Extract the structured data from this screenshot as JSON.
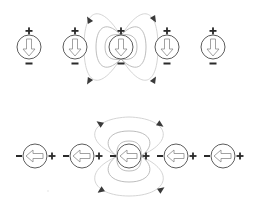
{
  "diagram": {
    "colors": {
      "background": "#ffffff",
      "magnet_outline": "#4a4a4a",
      "arrow_outline": "#8a8a8a",
      "field_line": "#cfcfcf",
      "sign": "#2a2a2a"
    },
    "top_row": {
      "orientation": "vertical-down",
      "arrow_direction": "down",
      "positive_label": "+",
      "negative_label": "−",
      "positive_position": "top",
      "negative_position": "bottom",
      "dipoles": [
        {
          "cx": 29,
          "cy": 47
        },
        {
          "cx": 75,
          "cy": 47
        },
        {
          "cx": 121,
          "cy": 47,
          "highlighted": true
        },
        {
          "cx": 167,
          "cy": 47
        },
        {
          "cx": 213,
          "cy": 47
        }
      ],
      "field_arrowheads": [
        {
          "x": 89,
          "y": 20,
          "direction": "up"
        },
        {
          "x": 154,
          "y": 19,
          "direction": "down"
        },
        {
          "x": 89,
          "y": 81,
          "direction": "up"
        },
        {
          "x": 154,
          "y": 80,
          "direction": "down"
        }
      ]
    },
    "bottom_row": {
      "orientation": "horizontal-left",
      "arrow_direction": "left",
      "positive_label": "+",
      "negative_label": "−",
      "positive_position": "right",
      "negative_position": "left",
      "dipoles": [
        {
          "cx": 35,
          "cy": 156
        },
        {
          "cx": 82,
          "cy": 156
        },
        {
          "cx": 129,
          "cy": 156,
          "highlighted": true
        },
        {
          "cx": 176,
          "cy": 156
        },
        {
          "cx": 223,
          "cy": 156
        }
      ],
      "field_arrowheads": [
        {
          "x": 99,
          "y": 123,
          "direction": "left"
        },
        {
          "x": 161,
          "y": 125,
          "direction": "right"
        },
        {
          "x": 100,
          "y": 191,
          "direction": "left"
        },
        {
          "x": 162,
          "y": 189,
          "direction": "right"
        }
      ]
    }
  }
}
